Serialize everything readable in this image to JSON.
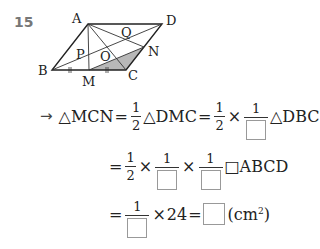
{
  "problem_number": "15",
  "figure": {
    "points": {
      "A": {
        "label": "A",
        "x": 88,
        "y": 24
      },
      "D": {
        "label": "D",
        "x": 162,
        "y": 24
      },
      "B": {
        "label": "B",
        "x": 52,
        "y": 70
      },
      "C": {
        "label": "C",
        "x": 126,
        "y": 70
      },
      "M": {
        "label": "M",
        "x": 89,
        "y": 70
      },
      "N": {
        "label": "N",
        "x": 144,
        "y": 47
      },
      "P": {
        "label": "P"
      },
      "Q": {
        "label": "Q"
      },
      "O": {
        "label": "O"
      }
    },
    "shaded_region": "triangle MCN",
    "shade_color": "#b8b8b8"
  },
  "solution": {
    "line1": {
      "arrow": "→",
      "t1": "△MCN",
      "eq1": "=",
      "f1_num": "1",
      "f1_den": "2",
      "t2": "△DMC",
      "eq2": "=",
      "f2_num": "1",
      "f2_den": "2",
      "times": "×",
      "f3_num": "1",
      "t3": "△DBC"
    },
    "line2": {
      "eq": "=",
      "f1_num": "1",
      "f1_den": "2",
      "times1": "×",
      "f2_num": "1",
      "times2": "×",
      "f3_num": "1",
      "t": "□ABCD"
    },
    "line3": {
      "eq1": "=",
      "f1_num": "1",
      "times": "×",
      "value": "24",
      "eq2": "=",
      "unit_open": "(cm",
      "unit_exp": "2",
      "unit_close": ")"
    }
  }
}
